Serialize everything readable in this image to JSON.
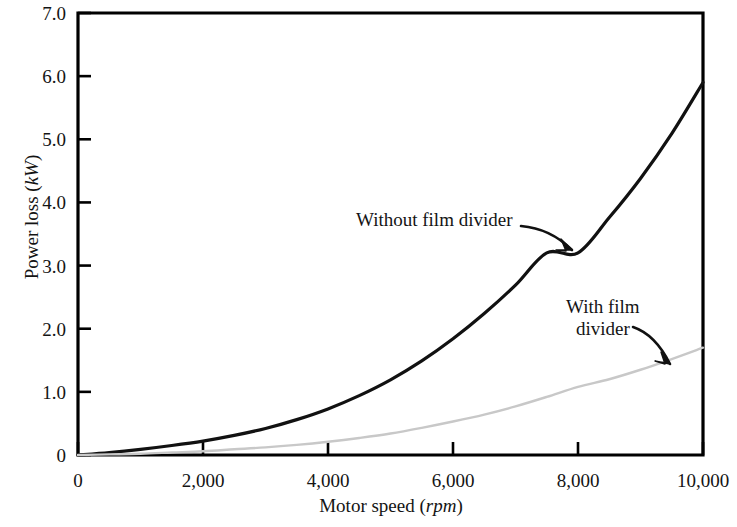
{
  "figure": {
    "background": "#ffffff",
    "frame_color": "#000000"
  },
  "axes": {
    "y": {
      "title_text": "Power loss (",
      "title_unit": "kW",
      "title_close": ")",
      "ticks": [
        "0",
        "1.0",
        "2.0",
        "3.0",
        "4.0",
        "5.0",
        "6.0",
        "7.0"
      ],
      "tick_values": [
        0,
        1.0,
        2.0,
        3.0,
        4.0,
        5.0,
        6.0,
        7.0
      ],
      "min": 0,
      "max": 7.0
    },
    "x": {
      "title_text": "Motor speed (",
      "title_unit": "rpm",
      "title_close": ")",
      "ticks": [
        "0",
        "2,000",
        "4,000",
        "6,000",
        "8,000",
        "10,000"
      ],
      "tick_values": [
        0,
        2000,
        4000,
        6000,
        8000,
        10000
      ],
      "min": 0,
      "max": 10000
    }
  },
  "annotations": {
    "without": {
      "label": "Without film divider",
      "target_x": 8000,
      "target_y": 3.2
    },
    "with": {
      "label": "With film\ndivider",
      "target_x": 9350,
      "target_y": 1.25
    }
  },
  "chart_data": {
    "type": "line",
    "title": "",
    "xlabel": "Motor speed (rpm)",
    "ylabel": "Power loss (kW)",
    "xlim": [
      0,
      10000
    ],
    "ylim": [
      0,
      7.0
    ],
    "xticks": [
      0,
      2000,
      4000,
      6000,
      8000,
      10000
    ],
    "xticklabels": [
      "0",
      "2,000",
      "4,000",
      "6,000",
      "8,000",
      "10,000"
    ],
    "yticks": [
      0,
      1.0,
      2.0,
      3.0,
      4.0,
      5.0,
      6.0,
      7.0
    ],
    "yticklabels": [
      "0",
      "1.0",
      "2.0",
      "3.0",
      "4.0",
      "5.0",
      "6.0",
      "7.0"
    ],
    "grid": false,
    "legend": "annotations-on-curves",
    "x": [
      0,
      500,
      1000,
      1500,
      2000,
      2500,
      3000,
      3500,
      4000,
      4500,
      5000,
      5500,
      6000,
      6500,
      7000,
      7500,
      8000,
      8500,
      9000,
      9500,
      10000
    ],
    "series": [
      {
        "name": "Without film divider",
        "color": "#111111",
        "width": 3.2,
        "values": [
          0,
          0.04,
          0.09,
          0.15,
          0.22,
          0.31,
          0.42,
          0.56,
          0.73,
          0.94,
          1.19,
          1.49,
          1.84,
          2.24,
          2.69,
          3.2,
          3.2,
          3.76,
          4.38,
          5.09,
          5.9
        ]
      },
      {
        "name": "With film divider",
        "color": "#c8c8c8",
        "width": 2.4,
        "values": [
          0,
          0.01,
          0.02,
          0.04,
          0.06,
          0.09,
          0.12,
          0.16,
          0.21,
          0.27,
          0.34,
          0.43,
          0.53,
          0.64,
          0.77,
          0.92,
          1.08,
          1.2,
          1.35,
          1.52,
          1.7
        ]
      }
    ]
  }
}
